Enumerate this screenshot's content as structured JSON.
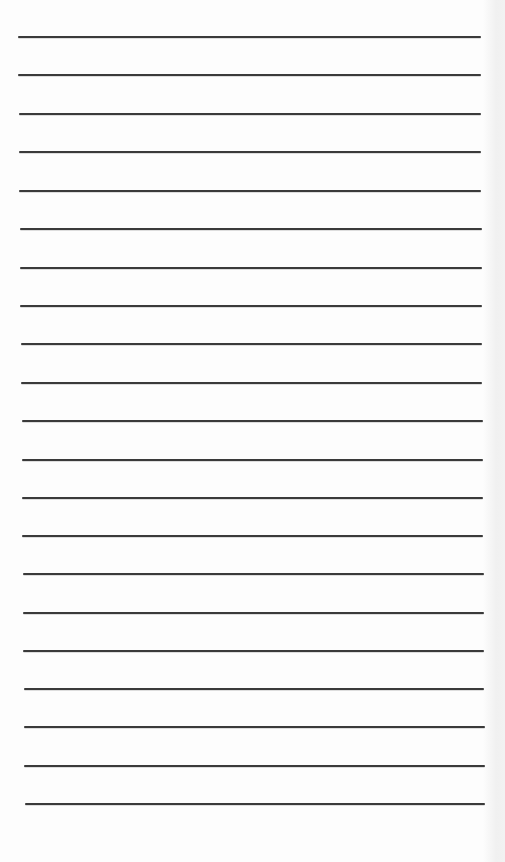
{
  "document": {
    "type": "lined-paper",
    "line_count": 21,
    "line_color": "#3a3a3a",
    "background_color": "#fdfdfd",
    "lines": [
      {
        "y": 36,
        "x1": 18,
        "x2": 481
      },
      {
        "y": 74,
        "x1": 18,
        "x2": 481
      },
      {
        "y": 113,
        "x1": 19,
        "x2": 481
      },
      {
        "y": 151,
        "x1": 19,
        "x2": 481
      },
      {
        "y": 190,
        "x1": 19,
        "x2": 481
      },
      {
        "y": 228,
        "x1": 20,
        "x2": 482
      },
      {
        "y": 267,
        "x1": 20,
        "x2": 482
      },
      {
        "y": 305,
        "x1": 20,
        "x2": 482
      },
      {
        "y": 343,
        "x1": 21,
        "x2": 482
      },
      {
        "y": 382,
        "x1": 21,
        "x2": 482
      },
      {
        "y": 420,
        "x1": 22,
        "x2": 483
      },
      {
        "y": 459,
        "x1": 22,
        "x2": 483
      },
      {
        "y": 497,
        "x1": 22,
        "x2": 483
      },
      {
        "y": 535,
        "x1": 22,
        "x2": 483
      },
      {
        "y": 573,
        "x1": 23,
        "x2": 484
      },
      {
        "y": 612,
        "x1": 23,
        "x2": 484
      },
      {
        "y": 650,
        "x1": 23,
        "x2": 484
      },
      {
        "y": 688,
        "x1": 24,
        "x2": 484
      },
      {
        "y": 726,
        "x1": 24,
        "x2": 485
      },
      {
        "y": 765,
        "x1": 24,
        "x2": 485
      },
      {
        "y": 803,
        "x1": 25,
        "x2": 485
      }
    ]
  }
}
